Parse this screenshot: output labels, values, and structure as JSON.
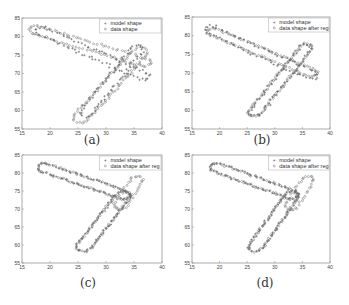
{
  "chart_data": [
    {
      "type": "scatter",
      "panel": "(a)",
      "caption": "(a)",
      "xlim": [
        15,
        40
      ],
      "ylim": [
        55,
        85
      ],
      "xticks": [
        15,
        20,
        25,
        30,
        35,
        40
      ],
      "yticks": [
        55,
        60,
        65,
        70,
        75,
        80,
        85
      ],
      "grid": false,
      "legend_position": "upper right",
      "series": [
        {
          "name": "model shape",
          "marker": "+"
        },
        {
          "name": "data shape",
          "marker": "o"
        }
      ]
    },
    {
      "type": "scatter",
      "panel": "(b)",
      "caption": "(b)",
      "xlim": [
        15,
        40
      ],
      "ylim": [
        55,
        85
      ],
      "xticks": [
        15,
        20,
        25,
        30,
        35,
        40
      ],
      "yticks": [
        55,
        60,
        65,
        70,
        75,
        80,
        85
      ],
      "grid": false,
      "legend_position": "upper right",
      "series": [
        {
          "name": "model shape",
          "marker": "+"
        },
        {
          "name": "data shape after reg",
          "marker": "o"
        }
      ]
    },
    {
      "type": "scatter",
      "panel": "(c)",
      "caption": "(c)",
      "xlim": [
        15,
        40
      ],
      "ylim": [
        55,
        85
      ],
      "xticks": [
        15,
        20,
        25,
        30,
        35,
        40
      ],
      "yticks": [
        55,
        60,
        65,
        70,
        75,
        80,
        85
      ],
      "grid": false,
      "legend_position": "upper right",
      "series": [
        {
          "name": "model shape",
          "marker": "+"
        },
        {
          "name": "data shape after reg",
          "marker": "o"
        }
      ]
    },
    {
      "type": "scatter",
      "panel": "(d)",
      "caption": "(d)",
      "xlim": [
        15,
        40
      ],
      "ylim": [
        55,
        85
      ],
      "xticks": [
        15,
        20,
        25,
        30,
        35,
        40
      ],
      "yticks": [
        55,
        60,
        65,
        70,
        75,
        80,
        85
      ],
      "grid": false,
      "legend_position": "upper right",
      "series": [
        {
          "name": "model shape",
          "marker": "+"
        },
        {
          "name": "data shape after reg",
          "marker": "o"
        }
      ]
    }
  ],
  "captions": {
    "a": "(a)",
    "b": "(b)",
    "c": "(c)",
    "d": "(d)"
  },
  "legends": {
    "a": {
      "model": "model shape",
      "data": "data shape"
    },
    "b": {
      "model": "model shape",
      "data": "data shape after reg"
    },
    "c": {
      "model": "model shape",
      "data": "data shape after reg"
    },
    "d": {
      "model": "model shape",
      "data": "data shape after reg"
    }
  },
  "ticks": {
    "x": [
      "15",
      "20",
      "25",
      "30",
      "35",
      "40"
    ],
    "y": [
      "55",
      "60",
      "65",
      "70",
      "75",
      "80",
      "85"
    ]
  },
  "colors": {
    "marker": "#7a7a7a",
    "axis": "#888888",
    "text": "#333333"
  }
}
